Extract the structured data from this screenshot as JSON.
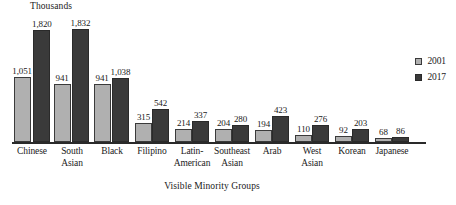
{
  "chart_data": {
    "type": "bar",
    "title": "",
    "unit_label": "Thousands",
    "xlabel": "Visible Minority Groups",
    "ylabel": "",
    "grid": false,
    "legend_position": "right",
    "ylim": [
      0,
      1832
    ],
    "categories": [
      [
        "Chinese"
      ],
      [
        "South",
        "Asian"
      ],
      [
        "Black"
      ],
      [
        "Filipino"
      ],
      [
        "Latin-",
        "American"
      ],
      [
        "Southeast",
        "Asian"
      ],
      [
        "Arab"
      ],
      [
        "West",
        "Asian"
      ],
      [
        "Korean"
      ],
      [
        "Japanese"
      ]
    ],
    "category_labels": [
      "Chinese",
      "South Asian",
      "Black",
      "Filipino",
      "Latin-American",
      "Southeast Asian",
      "Arab",
      "West Asian",
      "Korean",
      "Japanese"
    ],
    "series": [
      {
        "name": "2001",
        "color": "#b0b0b0",
        "values": [
          1051,
          941,
          941,
          315,
          214,
          204,
          194,
          110,
          92,
          68
        ],
        "value_labels": [
          "1,051",
          "941",
          "941",
          "315",
          "214",
          "204",
          "194",
          "110",
          "92",
          "68"
        ]
      },
      {
        "name": "2017",
        "color": "#3a3a3a",
        "values": [
          1820,
          1832,
          1038,
          542,
          337,
          280,
          423,
          276,
          203,
          86
        ],
        "value_labels": [
          "1,820",
          "1,832",
          "1,038",
          "542",
          "337",
          "280",
          "423",
          "276",
          "203",
          "86"
        ]
      }
    ]
  }
}
